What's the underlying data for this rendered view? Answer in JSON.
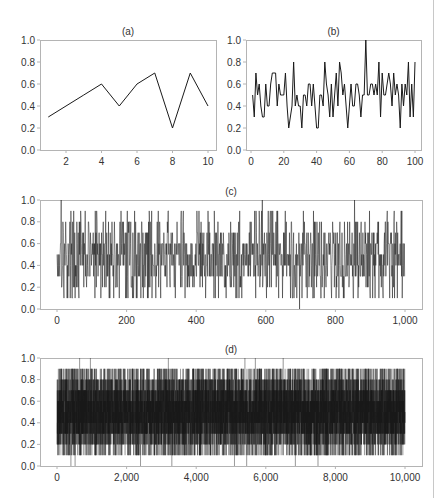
{
  "figure": {
    "panels": [
      "(a)",
      "(b)",
      "(c)",
      "(d)"
    ]
  },
  "chart_data": [
    {
      "id": "a",
      "type": "line",
      "title": "(a)",
      "xlabel": "",
      "ylabel": "",
      "x": [
        1,
        2,
        3,
        4,
        5,
        6,
        7,
        8,
        9,
        10
      ],
      "values": [
        0.3,
        0.4,
        0.5,
        0.6,
        0.4,
        0.6,
        0.7,
        0.2,
        0.7,
        0.4
      ],
      "xlim": [
        0.5,
        10.5
      ],
      "ylim": [
        0,
        1.0
      ],
      "xticks": [
        2,
        4,
        6,
        8,
        10
      ],
      "xtick_labels": [
        "2",
        "4",
        "6",
        "8",
        "10"
      ],
      "yticks": [
        0,
        0.2,
        0.4,
        0.6,
        0.8,
        1.0
      ],
      "ytick_labels": [
        "0.0",
        "0.2",
        "0.4",
        "0.6",
        "0.8",
        "1.0"
      ],
      "grid": false,
      "legend": null,
      "box": {
        "left": 40,
        "top": 40,
        "right": 216,
        "bottom": 150
      },
      "x_px": {
        "at": [
          2,
          10
        ],
        "px": [
          66,
          208
        ]
      }
    },
    {
      "id": "b",
      "type": "line",
      "title": "(b)",
      "xlabel": "",
      "ylabel": "",
      "n": 100,
      "values": [
        0.5,
        0.3,
        0.7,
        0.5,
        0.6,
        0.4,
        0.3,
        0.3,
        0.6,
        0.4,
        0.4,
        0.6,
        0.7,
        0.7,
        0.7,
        0.4,
        0.6,
        0.5,
        0.5,
        0.5,
        0.7,
        0.4,
        0.2,
        0.3,
        0.4,
        0.8,
        0.4,
        0.5,
        0.4,
        0.4,
        0.2,
        0.5,
        0.5,
        0.4,
        0.6,
        0.6,
        0.4,
        0.6,
        0.4,
        0.2,
        0.2,
        0.5,
        0.5,
        0.4,
        0.8,
        0.6,
        0.5,
        0.3,
        0.6,
        0.3,
        0.5,
        0.7,
        0.4,
        0.8,
        0.7,
        0.5,
        0.6,
        0.4,
        0.2,
        0.4,
        0.6,
        0.4,
        0.4,
        0.6,
        0.6,
        0.5,
        0.3,
        0.5,
        0.5,
        1.0,
        0.5,
        0.5,
        0.6,
        0.6,
        0.5,
        0.6,
        0.5,
        0.8,
        0.3,
        0.7,
        0.5,
        0.5,
        0.6,
        0.7,
        0.6,
        0.4,
        0.7,
        0.5,
        0.6,
        0.5,
        0.2,
        0.6,
        0.4,
        0.6,
        0.5,
        0.8,
        0.3,
        0.6,
        0.3,
        0.8
      ],
      "xlim": [
        -5,
        105
      ],
      "ylim": [
        0,
        1.0
      ],
      "xticks": [
        0,
        20,
        40,
        60,
        80,
        100
      ],
      "xtick_labels": [
        "0",
        "20",
        "40",
        "60",
        "80",
        "100"
      ],
      "yticks": [
        0,
        0.2,
        0.4,
        0.6,
        0.8,
        1.0
      ],
      "ytick_labels": [
        "0.0",
        "0.2",
        "0.4",
        "0.6",
        "0.8",
        "1.0"
      ],
      "grid": false,
      "legend": null,
      "box": {
        "left": 246,
        "top": 40,
        "right": 421,
        "bottom": 150
      },
      "x_px": {
        "at": [
          0,
          100
        ],
        "px": [
          251,
          415
        ]
      }
    },
    {
      "id": "c",
      "type": "line",
      "title": "(c)",
      "xlabel": "",
      "ylabel": "",
      "n": 1000,
      "generator": {
        "seed": 17,
        "mean": 0.48,
        "spread": 0.42,
        "quantize": 0.1,
        "spikes": [
          [
            12,
            1.0
          ],
          [
            590,
            1.0
          ],
          [
            855,
            1.0
          ],
          [
            697,
            0.0
          ]
        ]
      },
      "xlim": [
        -40,
        1040
      ],
      "ylim": [
        0,
        1.0
      ],
      "xticks": [
        0,
        200,
        400,
        600,
        800,
        1000
      ],
      "xtick_labels": [
        "0",
        "200",
        "400",
        "600",
        "800",
        "1,000"
      ],
      "yticks": [
        0,
        0.2,
        0.4,
        0.6,
        0.8,
        1.0
      ],
      "ytick_labels": [
        "0.0",
        "0.2",
        "0.4",
        "0.6",
        "0.8",
        "1.0"
      ],
      "grid": false,
      "legend": null,
      "box": {
        "left": 40,
        "top": 200,
        "right": 422,
        "bottom": 309
      },
      "x_px": {
        "at": [
          0,
          1000
        ],
        "px": [
          57,
          405
        ]
      }
    },
    {
      "id": "d",
      "type": "line",
      "title": "(d)",
      "xlabel": "",
      "ylabel": "",
      "n": 10000,
      "generator": {
        "seed": 91,
        "mean": 0.5,
        "spread": 0.44,
        "quantize": 0.1,
        "spikes": [
          [
            650,
            1.0
          ],
          [
            960,
            1.0
          ],
          [
            3200,
            1.0
          ],
          [
            5400,
            1.0
          ],
          [
            5700,
            1.0
          ],
          [
            6500,
            1.0
          ],
          [
            400,
            0.0
          ],
          [
            520,
            0.0
          ],
          [
            2400,
            0.0
          ],
          [
            3300,
            0.0
          ],
          [
            5100,
            0.0
          ],
          [
            5450,
            0.0
          ],
          [
            6850,
            0.0
          ],
          [
            7500,
            0.0
          ]
        ]
      },
      "xlim": [
        -400,
        10400
      ],
      "ylim": [
        0,
        1.0
      ],
      "xticks": [
        0,
        2000,
        4000,
        6000,
        8000,
        10000
      ],
      "xtick_labels": [
        "0",
        "2,000",
        "4,000",
        "6,000",
        "8,000",
        "10,000"
      ],
      "yticks": [
        0,
        0.2,
        0.4,
        0.6,
        0.8,
        1.0
      ],
      "ytick_labels": [
        "0.0",
        "0.2",
        "0.4",
        "0.6",
        "0.8",
        "1.0"
      ],
      "grid": false,
      "legend": null,
      "box": {
        "left": 40,
        "top": 358,
        "right": 422,
        "bottom": 466
      },
      "x_px": {
        "at": [
          0,
          10000
        ],
        "px": [
          57,
          405
        ]
      }
    }
  ],
  "style": {
    "line_color": "#1a1a1a",
    "axis_color": "#b4b4b4",
    "text_color": "#333333",
    "page_edge_color": "#c8c8c8"
  }
}
